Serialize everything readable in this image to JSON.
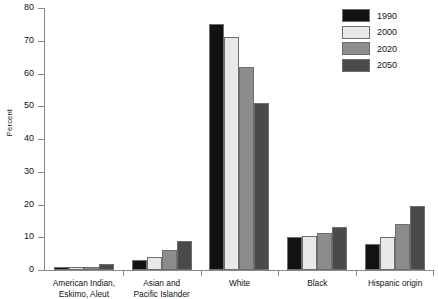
{
  "chart_data": {
    "type": "bar",
    "title": "",
    "xlabel": "",
    "ylabel": "Percent",
    "ylim": [
      0,
      80
    ],
    "yticks": [
      0,
      10,
      20,
      30,
      40,
      50,
      60,
      70,
      80
    ],
    "grid": false,
    "legend_position": "top-right",
    "categories": [
      "American Indian, Eskimo, Aleut",
      "Asian and Pacific Islander",
      "White",
      "Black",
      "Hispanic origin"
    ],
    "category_lines": [
      [
        "American Indian,",
        "Eskimo, Aleut"
      ],
      [
        "Asian and",
        "Pacific Islander"
      ],
      [
        "White"
      ],
      [
        "Black"
      ],
      [
        "Hispanic origin"
      ]
    ],
    "series": [
      {
        "name": "1990",
        "color": "#121212",
        "values": [
          1.0,
          3.0,
          75.0,
          10.0,
          8.0
        ]
      },
      {
        "name": "2000",
        "color": "#e8e8e8",
        "values": [
          0.9,
          4.0,
          71.0,
          10.5,
          10.0
        ]
      },
      {
        "name": "2020",
        "color": "#8c8c8c",
        "values": [
          0.8,
          6.0,
          62.0,
          11.2,
          14.0
        ]
      },
      {
        "name": "2050",
        "color": "#4a4a4a",
        "values": [
          1.8,
          9.0,
          51.0,
          13.0,
          19.5
        ]
      }
    ]
  },
  "axis": {
    "y_title": "Percent",
    "tick_labels": [
      "0",
      "10",
      "20",
      "30",
      "40",
      "50",
      "60",
      "70",
      "80"
    ]
  },
  "legend": {
    "entries": [
      {
        "label": "1990"
      },
      {
        "label": "2000"
      },
      {
        "label": "2020"
      },
      {
        "label": "2050"
      }
    ]
  }
}
